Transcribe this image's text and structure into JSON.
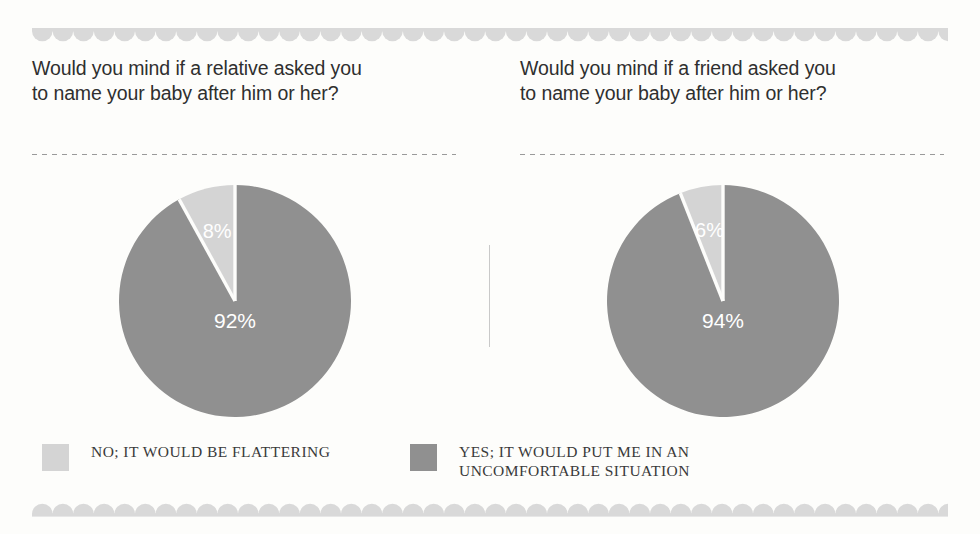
{
  "page": {
    "background_color": "#fdfdfb",
    "ornament_color": "#d9d9d9",
    "divider_color": "#c9c9c9"
  },
  "colors": {
    "slice_light": "#d4d4d4",
    "slice_dark": "#909090",
    "label_text": "#ffffff",
    "heading_text": "#2f2f2f",
    "legend_text": "#3a3a3a"
  },
  "panels": [
    {
      "id": "relative",
      "heading": "Would you mind if a relative asked you\nto name your baby after him or her?",
      "labels": {
        "light": "8%",
        "dark": "92%"
      }
    },
    {
      "id": "friend",
      "heading": "Would you mind if a friend asked you\nto name your baby after him or her?",
      "labels": {
        "light": "6%",
        "dark": "94%"
      }
    }
  ],
  "legend": {
    "items": [
      {
        "label": "NO; IT WOULD BE FLATTERING",
        "color": "#d4d4d4"
      },
      {
        "label": "YES; IT WOULD PUT ME IN AN\nUNCOMFORTABLE SITUATION",
        "color": "#909090"
      }
    ]
  },
  "chart_data": [
    {
      "type": "pie",
      "title": "Would you mind if a relative asked you to name your baby after him or her?",
      "categories": [
        "NO; IT WOULD BE FLATTERING",
        "YES; IT WOULD PUT ME IN AN UNCOMFORTABLE SITUATION"
      ],
      "values": [
        8,
        92
      ],
      "value_labels": [
        "8%",
        "92%"
      ],
      "colors": [
        "#d4d4d4",
        "#909090"
      ],
      "units": "percent",
      "start_angle_deg": 0,
      "direction": "counterclockwise",
      "legend_position": "bottom",
      "grid": false
    },
    {
      "type": "pie",
      "title": "Would you mind if a friend asked you to name your baby after him or her?",
      "categories": [
        "NO; IT WOULD BE FLATTERING",
        "YES; IT WOULD PUT ME IN AN UNCOMFORTABLE SITUATION"
      ],
      "values": [
        6,
        94
      ],
      "value_labels": [
        "6%",
        "94%"
      ],
      "colors": [
        "#d4d4d4",
        "#909090"
      ],
      "units": "percent",
      "start_angle_deg": 0,
      "direction": "counterclockwise",
      "legend_position": "bottom",
      "grid": false
    }
  ]
}
